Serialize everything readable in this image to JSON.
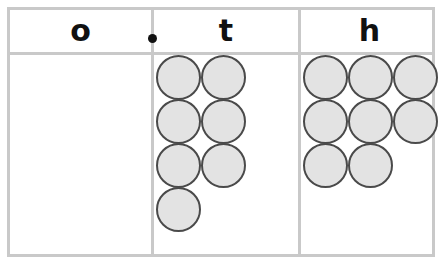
{
  "diagram": {
    "type": "place-value-counter-chart",
    "title": "",
    "columns": [
      {
        "key": "ones",
        "label": "o",
        "label_meaning": "ones",
        "counter_count": 0,
        "rows": []
      },
      {
        "key": "tenths",
        "label": "t",
        "label_meaning": "tenths",
        "counter_count": 7,
        "rows": [
          2,
          2,
          2,
          1
        ]
      },
      {
        "key": "hundredths",
        "label": "h",
        "label_meaning": "hundredths",
        "counter_count": 8,
        "rows": [
          3,
          3,
          2
        ]
      }
    ],
    "decimal_point": ".",
    "counter_icon": "circle-counter-icon",
    "colors": {
      "counter_fill": "#e3e3e3",
      "counter_stroke": "#4a4a4a",
      "table_border": "#c9c9c9",
      "text": "#111111",
      "background": "#ffffff"
    }
  }
}
